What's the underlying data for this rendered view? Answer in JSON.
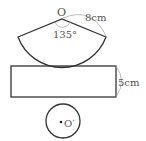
{
  "diagram": {
    "sector": {
      "center_label": "O",
      "radius_label": "8cm",
      "angle_label": "135°"
    },
    "rectangle": {
      "height_label": "5cm"
    },
    "circle": {
      "center_label": "O′"
    },
    "colors": {
      "stroke": "#333333",
      "text": "#555555",
      "annotation": "#aaaaaa",
      "background": "#ffffff"
    }
  }
}
